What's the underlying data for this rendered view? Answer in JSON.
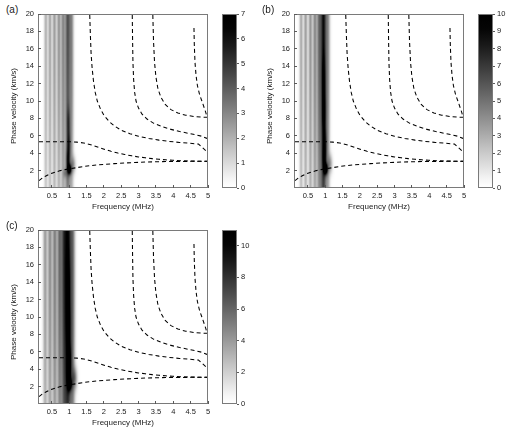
{
  "figure": {
    "background": "#ffffff",
    "panel_count": 3
  },
  "axes": {
    "xlabel": "Frequency (MHz)",
    "ylabel": "Phase velocity (km/s)",
    "xlim": [
      0.1,
      5
    ],
    "ylim": [
      0,
      20
    ],
    "xticks": [
      0.5,
      1,
      1.5,
      2,
      2.5,
      3,
      3.5,
      4,
      4.5,
      5
    ],
    "xticklabels": [
      "0.5",
      "1",
      "1.5",
      "2",
      "2.5",
      "3",
      "3.5",
      "4",
      "4.5",
      "5"
    ],
    "yticks": [
      2,
      4,
      6,
      8,
      10,
      12,
      14,
      16,
      18,
      20
    ],
    "yticklabels": [
      "2",
      "4",
      "6",
      "8",
      "10",
      "12",
      "14",
      "16",
      "18",
      "20"
    ]
  },
  "colormap": {
    "name": "inverted-grayscale",
    "low_color": "#ffffff",
    "high_color": "#000000"
  },
  "chart_data": [
    {
      "type": "heatmap",
      "panel": "a",
      "panel_label": "(a)",
      "title": "",
      "xlabel": "Frequency (MHz)",
      "ylabel": "Phase velocity (km/s)",
      "xlim": [
        0.1,
        5
      ],
      "ylim": [
        0,
        20
      ],
      "grid": false,
      "colorbar": {
        "min": 0,
        "max": 7,
        "ticks": [
          0,
          1,
          2,
          3,
          4,
          5,
          6,
          7
        ],
        "ticklabels": [
          "0",
          "1",
          "2",
          "3",
          "4",
          "5",
          "6",
          "7"
        ],
        "position": "right"
      },
      "intensity_bands": [
        {
          "freq": 0.3,
          "width": 0.045,
          "peak": 1.6,
          "v_center": 20,
          "v_spread": 22
        },
        {
          "freq": 0.42,
          "width": 0.045,
          "peak": 1.9,
          "v_center": 20,
          "v_spread": 22
        },
        {
          "freq": 0.55,
          "width": 0.05,
          "peak": 2.1,
          "v_center": 20,
          "v_spread": 22
        },
        {
          "freq": 0.68,
          "width": 0.05,
          "peak": 2.3,
          "v_center": 20,
          "v_spread": 22
        },
        {
          "freq": 0.8,
          "width": 0.055,
          "peak": 2.6,
          "v_center": 20,
          "v_spread": 22
        },
        {
          "freq": 0.94,
          "width": 0.075,
          "peak": 4.4,
          "v_center": 20,
          "v_spread": 24
        },
        {
          "freq": 1.05,
          "width": 0.055,
          "peak": 2.4,
          "v_center": 17,
          "v_spread": 16
        }
      ],
      "hot_spots": [
        {
          "freq": 0.99,
          "velocity": 2.05,
          "fw": 0.055,
          "vw": 0.55,
          "peak": 7.0
        },
        {
          "freq": 0.95,
          "velocity": 3.1,
          "fw": 0.055,
          "vw": 1.3,
          "peak": 3.4
        },
        {
          "freq": 0.97,
          "velocity": 5.0,
          "fw": 0.05,
          "vw": 1.4,
          "peak": 2.6
        },
        {
          "freq": 0.96,
          "velocity": 7.5,
          "fw": 0.048,
          "vw": 1.8,
          "peak": 2.1
        },
        {
          "freq": 1.1,
          "velocity": 2.6,
          "fw": 0.06,
          "vw": 0.9,
          "peak": 2.0
        },
        {
          "freq": 0.86,
          "velocity": 1.6,
          "fw": 0.05,
          "vw": 0.5,
          "peak": 1.6
        }
      ]
    },
    {
      "type": "heatmap",
      "panel": "b",
      "panel_label": "(b)",
      "title": "",
      "xlabel": "Frequency (MHz)",
      "ylabel": "Phase velocity (km/s)",
      "xlim": [
        0.1,
        5
      ],
      "ylim": [
        0,
        20
      ],
      "grid": false,
      "colorbar": {
        "min": 0,
        "max": 10,
        "ticks": [
          0,
          1,
          2,
          3,
          4,
          5,
          6,
          7,
          8,
          9,
          10
        ],
        "ticklabels": [
          "0",
          "1",
          "2",
          "3",
          "4",
          "5",
          "6",
          "7",
          "8",
          "9",
          "10"
        ],
        "position": "right"
      },
      "intensity_bands": [
        {
          "freq": 0.28,
          "width": 0.045,
          "peak": 2.6,
          "v_center": 20,
          "v_spread": 24
        },
        {
          "freq": 0.41,
          "width": 0.048,
          "peak": 3.0,
          "v_center": 20,
          "v_spread": 24
        },
        {
          "freq": 0.55,
          "width": 0.05,
          "peak": 3.3,
          "v_center": 20,
          "v_spread": 24
        },
        {
          "freq": 0.68,
          "width": 0.052,
          "peak": 3.8,
          "v_center": 20,
          "v_spread": 24
        },
        {
          "freq": 0.8,
          "width": 0.058,
          "peak": 4.4,
          "v_center": 20,
          "v_spread": 24
        },
        {
          "freq": 0.93,
          "width": 0.085,
          "peak": 9.5,
          "v_center": 20,
          "v_spread": 26
        },
        {
          "freq": 1.06,
          "width": 0.055,
          "peak": 3.2,
          "v_center": 16,
          "v_spread": 18
        }
      ],
      "hot_spots": [
        {
          "freq": 1.0,
          "velocity": 2.1,
          "fw": 0.055,
          "vw": 0.6,
          "peak": 10.0
        },
        {
          "freq": 0.96,
          "velocity": 3.2,
          "fw": 0.055,
          "vw": 1.4,
          "peak": 5.0
        },
        {
          "freq": 0.97,
          "velocity": 5.1,
          "fw": 0.055,
          "vw": 1.6,
          "peak": 4.2
        },
        {
          "freq": 0.95,
          "velocity": 8.5,
          "fw": 0.055,
          "vw": 2.4,
          "peak": 4.0
        },
        {
          "freq": 0.94,
          "velocity": 12.5,
          "fw": 0.05,
          "vw": 2.6,
          "peak": 3.2
        },
        {
          "freq": 1.12,
          "velocity": 2.7,
          "fw": 0.062,
          "vw": 1.0,
          "peak": 3.0
        }
      ]
    },
    {
      "type": "heatmap",
      "panel": "c",
      "panel_label": "(c)",
      "title": "",
      "xlabel": "Frequency (MHz)",
      "ylabel": "Phase velocity (km/s)",
      "xlim": [
        0.1,
        5
      ],
      "ylim": [
        0,
        20
      ],
      "grid": false,
      "colorbar": {
        "min": 0,
        "max": 11,
        "ticks": [
          0,
          2,
          4,
          6,
          8,
          10
        ],
        "ticklabels": [
          "0",
          "2",
          "4",
          "6",
          "8",
          "10"
        ],
        "position": "right"
      },
      "intensity_bands": [
        {
          "freq": 0.28,
          "width": 0.055,
          "peak": 3.4,
          "v_center": 20,
          "v_spread": 26
        },
        {
          "freq": 0.42,
          "width": 0.058,
          "peak": 4.0,
          "v_center": 20,
          "v_spread": 26
        },
        {
          "freq": 0.56,
          "width": 0.06,
          "peak": 4.6,
          "v_center": 20,
          "v_spread": 26
        },
        {
          "freq": 0.7,
          "width": 0.062,
          "peak": 5.4,
          "v_center": 20,
          "v_spread": 26
        },
        {
          "freq": 0.82,
          "width": 0.07,
          "peak": 6.4,
          "v_center": 20,
          "v_spread": 26
        },
        {
          "freq": 0.94,
          "width": 0.095,
          "peak": 11.0,
          "v_center": 20,
          "v_spread": 28
        },
        {
          "freq": 1.08,
          "width": 0.065,
          "peak": 5.0,
          "v_center": 15,
          "v_spread": 20
        }
      ],
      "hot_spots": [
        {
          "freq": 1.0,
          "velocity": 2.2,
          "fw": 0.06,
          "vw": 0.7,
          "peak": 8.0
        },
        {
          "freq": 0.97,
          "velocity": 3.4,
          "fw": 0.06,
          "vw": 1.5,
          "peak": 6.5
        },
        {
          "freq": 0.98,
          "velocity": 5.3,
          "fw": 0.06,
          "vw": 1.8,
          "peak": 6.0
        },
        {
          "freq": 0.96,
          "velocity": 9.0,
          "fw": 0.06,
          "vw": 2.8,
          "peak": 6.0
        },
        {
          "freq": 0.95,
          "velocity": 14.0,
          "fw": 0.055,
          "vw": 3.2,
          "peak": 5.0
        },
        {
          "freq": 1.14,
          "velocity": 2.9,
          "fw": 0.068,
          "vw": 1.2,
          "peak": 4.2
        }
      ]
    }
  ],
  "dispersion_curves": [
    {
      "name": "A0",
      "style": "dashed",
      "points": [
        [
          0.1,
          0.75
        ],
        [
          0.2,
          1.05
        ],
        [
          0.3,
          1.28
        ],
        [
          0.4,
          1.48
        ],
        [
          0.5,
          1.63
        ],
        [
          0.6,
          1.76
        ],
        [
          0.7,
          1.88
        ],
        [
          0.8,
          1.97
        ],
        [
          0.9,
          2.05
        ],
        [
          1.0,
          2.12
        ],
        [
          1.2,
          2.25
        ],
        [
          1.4,
          2.38
        ],
        [
          1.6,
          2.48
        ],
        [
          1.8,
          2.56
        ],
        [
          2.0,
          2.63
        ],
        [
          2.3,
          2.72
        ],
        [
          2.6,
          2.79
        ],
        [
          2.9,
          2.85
        ],
        [
          3.2,
          2.9
        ],
        [
          3.5,
          2.93
        ],
        [
          3.8,
          2.96
        ],
        [
          4.1,
          2.97
        ],
        [
          4.4,
          2.98
        ],
        [
          4.7,
          2.99
        ],
        [
          5.0,
          3.0
        ]
      ]
    },
    {
      "name": "S0",
      "style": "dashed",
      "points": [
        [
          0.1,
          5.25
        ],
        [
          0.4,
          5.26
        ],
        [
          0.7,
          5.27
        ],
        [
          1.0,
          5.26
        ],
        [
          1.2,
          5.22
        ],
        [
          1.4,
          5.12
        ],
        [
          1.55,
          4.98
        ],
        [
          1.7,
          4.8
        ],
        [
          1.85,
          4.6
        ],
        [
          2.0,
          4.4
        ],
        [
          2.2,
          4.15
        ],
        [
          2.4,
          3.95
        ],
        [
          2.6,
          3.78
        ],
        [
          2.8,
          3.63
        ],
        [
          3.0,
          3.5
        ],
        [
          3.2,
          3.4
        ],
        [
          3.4,
          3.3
        ],
        [
          3.6,
          3.22
        ],
        [
          3.8,
          3.16
        ],
        [
          4.0,
          3.1
        ],
        [
          4.3,
          3.05
        ],
        [
          4.6,
          3.01
        ],
        [
          5.0,
          2.98
        ]
      ]
    },
    {
      "name": "A1",
      "style": "dashed",
      "points": [
        [
          1.58,
          20.0
        ],
        [
          1.6,
          17.5
        ],
        [
          1.62,
          15.5
        ],
        [
          1.65,
          13.8
        ],
        [
          1.69,
          12.3
        ],
        [
          1.74,
          11.0
        ],
        [
          1.8,
          10.0
        ],
        [
          1.9,
          9.0
        ],
        [
          2.0,
          8.3
        ],
        [
          2.15,
          7.6
        ],
        [
          2.3,
          7.1
        ],
        [
          2.5,
          6.6
        ],
        [
          2.75,
          6.2
        ],
        [
          3.0,
          5.9
        ],
        [
          3.3,
          5.65
        ],
        [
          3.6,
          5.45
        ],
        [
          3.9,
          5.3
        ],
        [
          4.2,
          5.18
        ],
        [
          4.5,
          5.08
        ],
        [
          4.75,
          5.0
        ],
        [
          5.0,
          4.1
        ]
      ]
    },
    {
      "name": "S1",
      "style": "dashed",
      "points": [
        [
          2.82,
          20.0
        ],
        [
          2.83,
          17.0
        ],
        [
          2.84,
          14.5
        ],
        [
          2.86,
          12.5
        ],
        [
          2.89,
          11.0
        ],
        [
          2.93,
          10.0
        ],
        [
          3.0,
          9.2
        ],
        [
          3.1,
          8.5
        ],
        [
          3.25,
          7.9
        ],
        [
          3.45,
          7.4
        ],
        [
          3.7,
          7.0
        ],
        [
          3.95,
          6.7
        ],
        [
          4.2,
          6.45
        ],
        [
          4.45,
          6.25
        ],
        [
          4.7,
          6.05
        ],
        [
          4.85,
          5.9
        ],
        [
          5.0,
          5.65
        ]
      ]
    },
    {
      "name": "A2",
      "style": "dashed",
      "points": [
        [
          3.42,
          20.0
        ],
        [
          3.44,
          17.0
        ],
        [
          3.47,
          14.5
        ],
        [
          3.51,
          12.8
        ],
        [
          3.57,
          11.4
        ],
        [
          3.66,
          10.4
        ],
        [
          3.78,
          9.6
        ],
        [
          3.95,
          9.0
        ],
        [
          4.15,
          8.6
        ],
        [
          4.38,
          8.35
        ],
        [
          4.62,
          8.2
        ],
        [
          4.85,
          8.12
        ],
        [
          5.0,
          8.1
        ]
      ]
    },
    {
      "name": "S2",
      "style": "dashed",
      "points": [
        [
          4.62,
          18.5
        ],
        [
          4.63,
          16.5
        ],
        [
          4.65,
          14.5
        ],
        [
          4.68,
          13.0
        ],
        [
          4.72,
          11.8
        ],
        [
          4.78,
          10.8
        ],
        [
          4.85,
          10.0
        ],
        [
          4.92,
          9.2
        ],
        [
          4.97,
          8.6
        ],
        [
          5.0,
          8.1
        ]
      ]
    }
  ]
}
